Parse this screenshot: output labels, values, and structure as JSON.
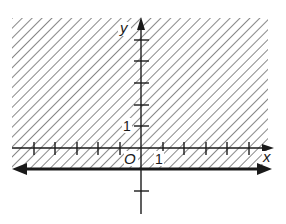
{
  "figure": {
    "inequality": "y ≥ -1",
    "boundary_line": {
      "equation": "y = -1",
      "style": "solid",
      "arrows": "both ends"
    },
    "shaded_region": "above boundary line",
    "axes": {
      "x_label": "x",
      "y_label": "y",
      "origin_label": "O",
      "x_unit_label": "1",
      "y_unit_label": "1",
      "x_ticks": [
        -5,
        -4,
        -3,
        -2,
        -1,
        1,
        2,
        3,
        4,
        5
      ],
      "y_ticks": [
        -2,
        1,
        2,
        3,
        4,
        5
      ]
    },
    "colors": {
      "ink": "#1a1a1a",
      "hatch": "#555555",
      "background": "#ffffff"
    }
  }
}
